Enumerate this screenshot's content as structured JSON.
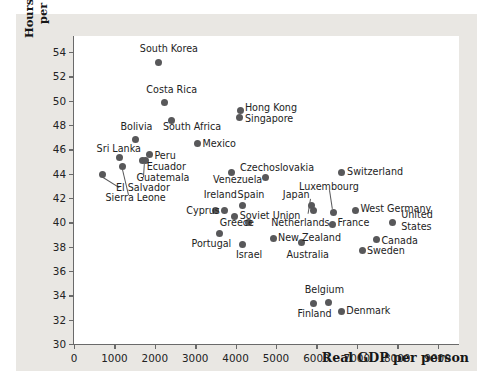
{
  "figure": {
    "background_color": "#e9e7e3",
    "plot_background_color": "#ffffff",
    "axis_color": "#6a6a6a",
    "marker_color": "#58585a"
  },
  "chart_data": {
    "type": "scatter",
    "title": "",
    "xlabel": "Real GDP per person",
    "ylabel_line1": "Hours of work",
    "ylabel_line2": "per week",
    "xlim": [
      0,
      9530
    ],
    "ylim": [
      30,
      55.3
    ],
    "xticks": [
      0,
      1000,
      2000,
      3000,
      4000,
      5000,
      6000,
      7000,
      8000,
      9000
    ],
    "xticklabels": [
      "0",
      "1000",
      "2000",
      "3000",
      "4000",
      "5000",
      "6000",
      "7000",
      "8000",
      "9000"
    ],
    "yticks": [
      30,
      32,
      34,
      36,
      38,
      40,
      42,
      44,
      46,
      48,
      50,
      52,
      54
    ],
    "yticklabels": [
      "30",
      "32",
      "34",
      "36",
      "38",
      "40",
      "42",
      "44",
      "46",
      "48",
      "50",
      "52",
      "54"
    ],
    "grid": false,
    "legend": false,
    "points": [
      {
        "name": "South Korea",
        "x": 2100,
        "y": 53.1
      },
      {
        "name": "Costa Rica",
        "x": 2240,
        "y": 49.85
      },
      {
        "name": "South Africa",
        "x": 2420,
        "y": 48.4
      },
      {
        "name": "Bolivia",
        "x": 1520,
        "y": 46.8
      },
      {
        "name": "Mexico",
        "x": 3060,
        "y": 46.45
      },
      {
        "name": "Peru",
        "x": 1870,
        "y": 45.6
      },
      {
        "name": "Sri Lanka",
        "x": 1130,
        "y": 45.3
      },
      {
        "name": "Ecuador",
        "x": 1700,
        "y": 45.05
      },
      {
        "name": "Guatemala",
        "x": 1760,
        "y": 45.05
      },
      {
        "name": "El Salvador",
        "x": 1210,
        "y": 44.55
      },
      {
        "name": "Sierra Leone",
        "x": 700,
        "y": 43.95
      },
      {
        "name": "Hong Kong",
        "x": 4110,
        "y": 49.15
      },
      {
        "name": "Singapore",
        "x": 4090,
        "y": 48.6
      },
      {
        "name": "Czechoslovakia",
        "x": 4730,
        "y": 43.65
      },
      {
        "name": "Venezuela",
        "x": 3900,
        "y": 44.1
      },
      {
        "name": "Switzerland",
        "x": 6620,
        "y": 44.1
      },
      {
        "name": "Spain",
        "x": 4180,
        "y": 41.35
      },
      {
        "name": "Ireland",
        "x": 3730,
        "y": 41.0
      },
      {
        "name": "Cyprus",
        "x": 3500,
        "y": 41.0
      },
      {
        "name": "Soviet Union",
        "x": 3970,
        "y": 40.5
      },
      {
        "name": "Greece",
        "x": 4330,
        "y": 39.95
      },
      {
        "name": "Netherlands",
        "x": 5920,
        "y": 40.95
      },
      {
        "name": "Japan",
        "x": 5890,
        "y": 41.4
      },
      {
        "name": "Luxembourg",
        "x": 6430,
        "y": 40.8
      },
      {
        "name": "France",
        "x": 6410,
        "y": 39.85
      },
      {
        "name": "West Germany",
        "x": 6960,
        "y": 41.0
      },
      {
        "name": "United States",
        "x": 7890,
        "y": 40.0
      },
      {
        "name": "New Zealand",
        "x": 4930,
        "y": 38.7
      },
      {
        "name": "Portugal",
        "x": 3600,
        "y": 39.05
      },
      {
        "name": "Israel",
        "x": 4160,
        "y": 38.2
      },
      {
        "name": "Australia",
        "x": 5630,
        "y": 38.35
      },
      {
        "name": "Canada",
        "x": 7490,
        "y": 38.55
      },
      {
        "name": "Sweden",
        "x": 7130,
        "y": 37.7
      },
      {
        "name": "Belgium",
        "x": 6290,
        "y": 33.4
      },
      {
        "name": "Finland",
        "x": 5940,
        "y": 33.35
      },
      {
        "name": "Denmark",
        "x": 6620,
        "y": 32.7
      }
    ],
    "labels": [
      {
        "text": "South Korea",
        "x": 1630,
        "y": 54.25,
        "anchor": "left"
      },
      {
        "text": "Costa Rica",
        "x": 1790,
        "y": 50.9,
        "anchor": "left"
      },
      {
        "text": "South Africa",
        "x": 2200,
        "y": 47.85,
        "anchor": "left"
      },
      {
        "text": "Bolivia",
        "x": 1150,
        "y": 47.85,
        "anchor": "left"
      },
      {
        "text": "Mexico",
        "x": 3180,
        "y": 46.4,
        "anchor": "left"
      },
      {
        "text": "Peru",
        "x": 1990,
        "y": 45.45,
        "anchor": "left"
      },
      {
        "text": "Sri Lanka",
        "x": 560,
        "y": 46.05,
        "anchor": "left"
      },
      {
        "text": "Ecuador",
        "x": 1800,
        "y": 44.5,
        "anchor": "left"
      },
      {
        "text": "Guatemala",
        "x": 1550,
        "y": 43.6,
        "anchor": "left"
      },
      {
        "text": "El Salvador",
        "x": 1040,
        "y": 42.85,
        "anchor": "left"
      },
      {
        "text": "Sierra Leone",
        "x": 780,
        "y": 42.0,
        "anchor": "left"
      },
      {
        "text": "Hong Kong",
        "x": 4230,
        "y": 49.35,
        "anchor": "left"
      },
      {
        "text": "Singapore",
        "x": 4230,
        "y": 48.5,
        "anchor": "left"
      },
      {
        "text": "Czechoslovakia",
        "x": 4110,
        "y": 44.45,
        "anchor": "left"
      },
      {
        "text": "Venezuela",
        "x": 3440,
        "y": 43.5,
        "anchor": "left"
      },
      {
        "text": "Switzerland",
        "x": 6760,
        "y": 44.1,
        "anchor": "left"
      },
      {
        "text": "Spain",
        "x": 4050,
        "y": 42.25,
        "anchor": "left"
      },
      {
        "text": "Ireland",
        "x": 3210,
        "y": 42.2,
        "anchor": "left"
      },
      {
        "text": "Cyprus",
        "x": 2780,
        "y": 40.9,
        "anchor": "left"
      },
      {
        "text": "Soviet Union",
        "x": 4100,
        "y": 40.55,
        "anchor": "left"
      },
      {
        "text": "Greece",
        "x": 3610,
        "y": 39.9,
        "anchor": "left"
      },
      {
        "text": "Netherlands",
        "x": 4880,
        "y": 39.95,
        "anchor": "left"
      },
      {
        "text": "Japan",
        "x": 5170,
        "y": 42.25,
        "anchor": "left"
      },
      {
        "text": "Luxembourg",
        "x": 5570,
        "y": 42.9,
        "anchor": "left"
      },
      {
        "text": "France",
        "x": 6520,
        "y": 39.9,
        "anchor": "left"
      },
      {
        "text": "West Germany",
        "x": 7090,
        "y": 41.05,
        "anchor": "left"
      },
      {
        "text": "United",
        "x": 8100,
        "y": 40.6,
        "anchor": "left"
      },
      {
        "text": "States",
        "x": 8100,
        "y": 39.65,
        "anchor": "left"
      },
      {
        "text": "New Zealand",
        "x": 5050,
        "y": 38.7,
        "anchor": "left"
      },
      {
        "text": "Portugal",
        "x": 2910,
        "y": 38.25,
        "anchor": "left"
      },
      {
        "text": "Israel",
        "x": 4010,
        "y": 37.3,
        "anchor": "left"
      },
      {
        "text": "Australia",
        "x": 5260,
        "y": 37.35,
        "anchor": "left"
      },
      {
        "text": "Canada",
        "x": 7610,
        "y": 38.5,
        "anchor": "left"
      },
      {
        "text": "Sweden",
        "x": 7250,
        "y": 37.65,
        "anchor": "left"
      },
      {
        "text": "Belgium",
        "x": 5710,
        "y": 34.4,
        "anchor": "left"
      },
      {
        "text": "Finland",
        "x": 5530,
        "y": 32.45,
        "anchor": "left"
      },
      {
        "text": "Denmark",
        "x": 6740,
        "y": 32.7,
        "anchor": "left"
      }
    ],
    "leaders": [
      {
        "from_x": 1110,
        "from_y": 42.85,
        "to_x": 700,
        "to_y": 43.7
      },
      {
        "from_x": 1340,
        "from_y": 42.2,
        "to_x": 1190,
        "to_y": 44.3
      },
      {
        "from_x": 1700,
        "from_y": 43.75,
        "to_x": 1720,
        "to_y": 44.85
      },
      {
        "from_x": 6330,
        "from_y": 42.65,
        "to_x": 6400,
        "to_y": 41.1
      },
      {
        "from_x": 5860,
        "from_y": 41.9,
        "to_x": 5800,
        "to_y": 40.7
      }
    ]
  }
}
